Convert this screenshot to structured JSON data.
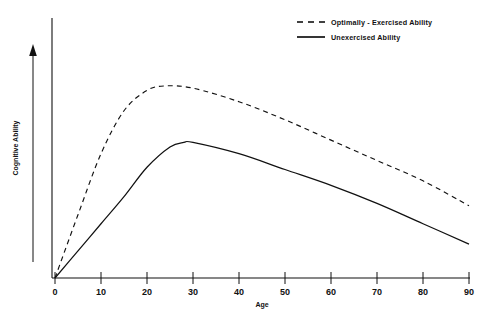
{
  "chart_data": {
    "type": "line",
    "title": "",
    "xlabel": "Age",
    "ylabel": "Cognitive Ability",
    "xlim": [
      0,
      90
    ],
    "ylim": [
      0,
      100
    ],
    "grid": false,
    "legend_position": "top-right",
    "xticks": [
      "0",
      "10",
      "20",
      "30",
      "40",
      "50",
      "60",
      "70",
      "80",
      "90"
    ],
    "xtick_values": [
      0,
      10,
      20,
      30,
      40,
      50,
      60,
      70,
      80,
      90
    ],
    "yticks": [],
    "series": [
      {
        "name": "Optimally - Exercised Ability",
        "style": "dashed",
        "color": "#111111",
        "x": [
          0,
          5,
          10,
          15,
          20,
          24,
          30,
          40,
          50,
          60,
          70,
          80,
          90
        ],
        "values": [
          0,
          28,
          55,
          74,
          83,
          85,
          84,
          78,
          70,
          61,
          52,
          43,
          32
        ]
      },
      {
        "name": "Unexercised Ability",
        "style": "solid",
        "color": "#111111",
        "x": [
          0,
          5,
          10,
          15,
          20,
          25,
          28,
          30,
          40,
          50,
          60,
          70,
          80,
          90
        ],
        "values": [
          0,
          12,
          24,
          36,
          49,
          58,
          60,
          60,
          55,
          48,
          41,
          33,
          24,
          15
        ]
      }
    ],
    "annotations": [
      {
        "name": "y-axis-direction-arrow",
        "description": "upward arrow beside vertical axis"
      }
    ]
  },
  "legend": {
    "entries": [
      {
        "label": "Optimally - Exercised Ability",
        "style": "dashed"
      },
      {
        "label": "Unexercised Ability",
        "style": "solid"
      }
    ]
  },
  "axes": {
    "x_title": "Age",
    "y_title": "Cognitive Ability"
  }
}
